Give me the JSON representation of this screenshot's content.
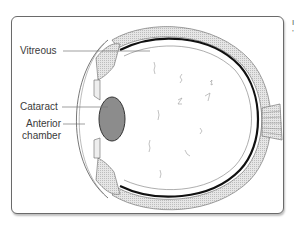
{
  "figure": {
    "type": "anatomical cross-section of the eye",
    "labels": [
      {
        "id": "vitreous",
        "text": "Vitreous"
      },
      {
        "id": "cataract",
        "text": "Cataract"
      },
      {
        "id": "anterior-chamber",
        "text": "Anterior chamber",
        "lines": [
          "Anterior",
          "chamber"
        ]
      }
    ],
    "colors": {
      "frame": "#6a6a6a",
      "lens": "#8c8c8c",
      "retina": "#111111",
      "sclera_fill": "#d9d9d9",
      "label_text": "#3a3a3a"
    }
  },
  "edge_text": [
    "I",
    "’"
  ]
}
